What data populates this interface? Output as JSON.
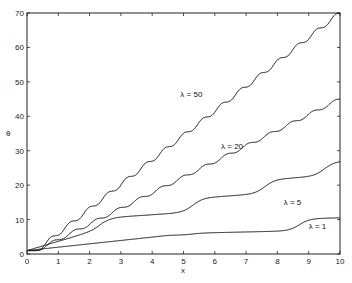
{
  "chart_data": {
    "type": "line",
    "title": "",
    "xlabel": "x",
    "ylabel": "θ",
    "xlim": [
      0,
      10
    ],
    "ylim": [
      0,
      70
    ],
    "xticks": [
      "0",
      "1",
      "2",
      "3",
      "4",
      "5",
      "6",
      "7",
      "8",
      "9",
      "10"
    ],
    "yticks": [
      "0",
      "10",
      "20",
      "30",
      "40",
      "50",
      "60",
      "70"
    ],
    "grid": false,
    "legend": "inline annotations",
    "series": [
      {
        "name": "λ = 50",
        "label_pos": [
          4.9,
          45.5
        ],
        "end": 70,
        "start": 1,
        "steps": 16,
        "mode": "strong"
      },
      {
        "name": "λ = 20",
        "label_pos": [
          6.2,
          30.5
        ],
        "end": 45,
        "start": 1,
        "steps": 14,
        "mode": "strong"
      },
      {
        "name": "λ = 5",
        "label_pos": [
          8.2,
          14.2
        ],
        "end": 23,
        "start": 1,
        "steps": 4,
        "mode": "weak"
      },
      {
        "name": "λ = 1",
        "label_pos": [
          9.0,
          7.2
        ],
        "end": 10.5,
        "start": 1,
        "steps": 2,
        "mode": "weak"
      }
    ]
  }
}
